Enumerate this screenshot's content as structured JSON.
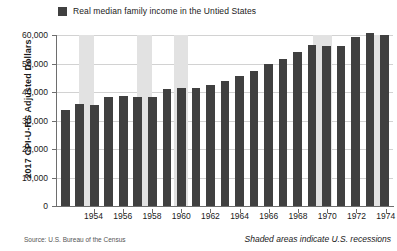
{
  "legend": {
    "swatch_color": "#404040",
    "label": "Real median family income in the Untied States"
  },
  "axis": {
    "ylabel": "2017 CPI-U-RS Adjusted Dollars",
    "yticks": [
      "60,000",
      "50,000",
      "40,000",
      "30,000",
      "20,000",
      "10,000",
      "0"
    ],
    "xticks": [
      "1954",
      "1956",
      "1958",
      "1960",
      "1962",
      "1964",
      "1966",
      "1968",
      "1970",
      "1972",
      "1974"
    ]
  },
  "notes": {
    "source": "Source: U.S. Bureau of the Census",
    "recession": "Shaded areas indicate U.S. recessions"
  },
  "colors": {
    "bar": "#404040",
    "recession_band": "#e2e2e2",
    "gridline": "#d2d2d2",
    "axis": "#6e6e6e",
    "plot_background": "#ffffff"
  },
  "chart_data": {
    "type": "bar",
    "title": "",
    "xlabel": "",
    "ylabel": "2017 CPI-U-RS Adjusted Dollars",
    "ylim": [
      0,
      60000
    ],
    "ytick_values": [
      0,
      10000,
      20000,
      30000,
      40000,
      50000,
      60000
    ],
    "grid": true,
    "legend_position": "top-left",
    "series_name": "Real median family income in the Untied States",
    "categories": [
      1952,
      1953,
      1954,
      1955,
      1956,
      1957,
      1958,
      1959,
      1960,
      1961,
      1962,
      1963,
      1964,
      1965,
      1966,
      1967,
      1968,
      1969,
      1970,
      1971,
      1972,
      1973,
      1974
    ],
    "values": [
      33700,
      35900,
      35600,
      38100,
      38600,
      38400,
      38200,
      41000,
      41300,
      41400,
      42400,
      43800,
      45600,
      47500,
      50000,
      51500,
      54200,
      56500,
      56200,
      56300,
      59200,
      60800,
      59900
    ],
    "recession_bands": [
      {
        "start": 1953.5,
        "end": 1954.5
      },
      {
        "start": 1957.5,
        "end": 1958.5
      },
      {
        "start": 1960.0,
        "end": 1961.0
      },
      {
        "start": 1969.5,
        "end": 1970.8
      },
      {
        "start": 1973.7,
        "end": 1974.6
      }
    ],
    "annotations": [
      "Source: U.S. Bureau of the Census",
      "Shaded areas indicate U.S. recessions"
    ]
  }
}
